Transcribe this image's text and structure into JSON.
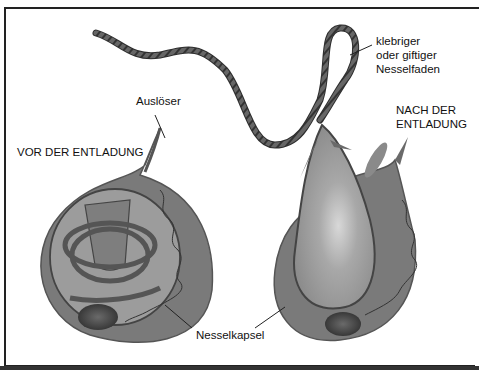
{
  "figure": {
    "panels": [
      {
        "id": "before",
        "title": "VOR DER ENTLADUNG"
      },
      {
        "id": "after",
        "title_line1": "NACH DER",
        "title_line2": "ENTLADUNG"
      }
    ],
    "labels": {
      "trigger": "Auslöser",
      "thread_line1": "klebriger",
      "thread_line2": "oder giftiger",
      "thread_line3": "Nesselfaden",
      "capsule": "Nesselkapsel"
    },
    "colors": {
      "cell_body": "#7a7a7a",
      "capsule_fill": "#9a9a9a",
      "nucleus": "#3a3a3a",
      "outline": "#333333",
      "background": "#ffffff"
    }
  }
}
